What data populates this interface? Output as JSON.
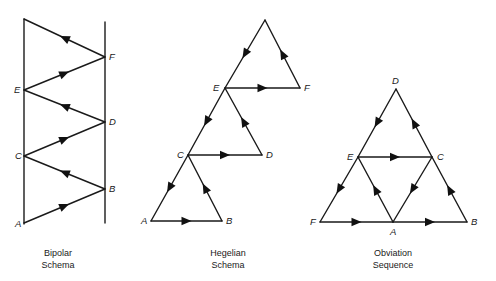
{
  "colors": {
    "background": "#ffffff",
    "ink": "#1a1a1a"
  },
  "diagrams": [
    {
      "id": "bipolar",
      "caption": [
        "Bipolar",
        "Schema"
      ],
      "caption_pos": [
        58,
        248
      ],
      "poles": [
        {
          "x1": 24,
          "y1": 19,
          "x2": 24,
          "y2": 224
        },
        {
          "x1": 105,
          "y1": 22,
          "x2": 105,
          "y2": 223
        }
      ],
      "vertices": {
        "A": {
          "x": 24,
          "y": 223,
          "label_dx": -9,
          "label_dy": 4
        },
        "B": {
          "x": 105,
          "y": 189,
          "label_dx": 4,
          "label_dy": 3
        },
        "C": {
          "x": 24,
          "y": 156,
          "label_dx": -9,
          "label_dy": 3
        },
        "D": {
          "x": 105,
          "y": 122,
          "label_dx": 4,
          "label_dy": 3
        },
        "E": {
          "x": 24,
          "y": 90,
          "label_dx": -10,
          "label_dy": 3
        },
        "F": {
          "x": 105,
          "y": 57,
          "label_dx": 4,
          "label_dy": 3
        },
        "T": {
          "x": 24,
          "y": 19,
          "label": ""
        }
      },
      "edges": [
        [
          "A",
          "B"
        ],
        [
          "B",
          "C"
        ],
        [
          "C",
          "D"
        ],
        [
          "D",
          "E"
        ],
        [
          "E",
          "F"
        ],
        [
          "F",
          "T"
        ]
      ]
    },
    {
      "id": "hegelian",
      "caption": [
        "Hegelian",
        "Schema"
      ],
      "caption_pos": [
        228,
        248
      ],
      "vertices": {
        "A": {
          "x": 151,
          "y": 221,
          "label_dx": -10,
          "label_dy": 3
        },
        "B": {
          "x": 222,
          "y": 221,
          "label_dx": 4,
          "label_dy": 3
        },
        "C": {
          "x": 188,
          "y": 155,
          "label_dx": -11,
          "label_dy": 3
        },
        "D": {
          "x": 262,
          "y": 155,
          "label_dx": 4,
          "label_dy": 3
        },
        "E": {
          "x": 225,
          "y": 88,
          "label_dx": -12,
          "label_dy": 3
        },
        "F": {
          "x": 300,
          "y": 88,
          "label_dx": 4,
          "label_dy": 3
        },
        "T": {
          "x": 265,
          "y": 20,
          "label": ""
        }
      },
      "edges": [
        [
          "C",
          "A"
        ],
        [
          "A",
          "B"
        ],
        [
          "B",
          "C"
        ],
        [
          "E",
          "C"
        ],
        [
          "C",
          "D"
        ],
        [
          "D",
          "E"
        ],
        [
          "T",
          "E"
        ],
        [
          "E",
          "F"
        ],
        [
          "F",
          "T"
        ]
      ]
    },
    {
      "id": "obviation",
      "caption": [
        "Obviation",
        "Sequence"
      ],
      "caption_pos": [
        393,
        248
      ],
      "vertices": {
        "D": {
          "x": 396,
          "y": 89,
          "label_dx": -4,
          "label_dy": -5
        },
        "E": {
          "x": 358,
          "y": 157,
          "label_dx": -11,
          "label_dy": 3
        },
        "C": {
          "x": 432,
          "y": 157,
          "label_dx": 5,
          "label_dy": 3
        },
        "F": {
          "x": 320,
          "y": 222,
          "label_dx": -10,
          "label_dy": 3
        },
        "A": {
          "x": 393,
          "y": 222,
          "label_dx": -3,
          "label_dy": 13
        },
        "B": {
          "x": 467,
          "y": 222,
          "label_dx": 4,
          "label_dy": 3
        }
      },
      "edges": [
        [
          "D",
          "E"
        ],
        [
          "E",
          "F"
        ],
        [
          "F",
          "A"
        ],
        [
          "A",
          "E"
        ],
        [
          "E",
          "C"
        ],
        [
          "C",
          "A"
        ],
        [
          "A",
          "B"
        ],
        [
          "B",
          "C"
        ],
        [
          "C",
          "D"
        ]
      ]
    }
  ]
}
